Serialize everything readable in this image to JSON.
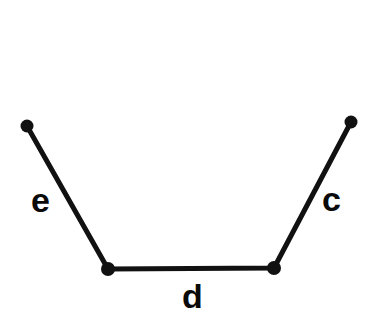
{
  "figure": {
    "background_color": "#ffffff",
    "stroke_color": "#111111",
    "stroke_width": 5,
    "vertex_color": "#111111",
    "label_color": "#0a0a0a",
    "canvas": {
      "width": 382,
      "height": 316
    },
    "vertices": [
      {
        "name": "left-endpoint",
        "x": 27,
        "y": 126,
        "radius": 6.5
      },
      {
        "name": "bottom-left-vertex",
        "x": 108,
        "y": 269,
        "radius": 7
      },
      {
        "name": "bottom-right-vertex",
        "x": 274,
        "y": 268,
        "radius": 7
      },
      {
        "name": "right-endpoint",
        "x": 351,
        "y": 122,
        "radius": 6.5
      }
    ],
    "segments": [
      {
        "name": "segment-e",
        "label": "e",
        "from": "left-endpoint",
        "to": "bottom-left-vertex",
        "label_x": 31,
        "label_y": 183
      },
      {
        "name": "segment-d",
        "label": "d",
        "from": "bottom-left-vertex",
        "to": "bottom-right-vertex",
        "label_x": 182,
        "label_y": 279
      },
      {
        "name": "segment-c",
        "label": "c",
        "from": "bottom-right-vertex",
        "to": "right-endpoint",
        "label_x": 322,
        "label_y": 182
      }
    ],
    "polyline_points": "27,126 108,269 274,268 351,122"
  }
}
